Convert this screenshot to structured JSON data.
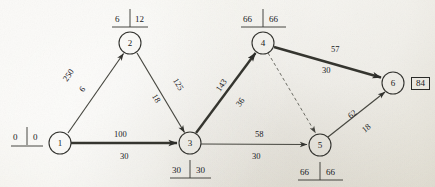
{
  "diagram": {
    "nodes": [
      {
        "id": "1",
        "label": "1",
        "cx": 60,
        "cy": 143,
        "r": 11
      },
      {
        "id": "2",
        "label": "2",
        "cx": 130,
        "cy": 43,
        "r": 11
      },
      {
        "id": "3",
        "label": "3",
        "cx": 190,
        "cy": 143,
        "r": 11
      },
      {
        "id": "4",
        "label": "4",
        "cx": 263,
        "cy": 43,
        "r": 11
      },
      {
        "id": "5",
        "label": "5",
        "cx": 320,
        "cy": 145,
        "r": 11
      },
      {
        "id": "6",
        "label": "6",
        "cx": 393,
        "cy": 83,
        "r": 11
      }
    ],
    "node_annotations": [
      {
        "node": "1",
        "left": "0",
        "right": "0",
        "position": "left",
        "x": 10,
        "y": 134
      },
      {
        "node": "2",
        "left": "6",
        "right": "12",
        "position": "top",
        "x": 106,
        "y": 14
      },
      {
        "node": "3",
        "left": "30",
        "right": "30",
        "position": "bottom",
        "x": 166,
        "y": 163
      },
      {
        "node": "4",
        "left": "66",
        "right": "66",
        "position": "top",
        "x": 239,
        "y": 14
      },
      {
        "node": "5",
        "left": "66",
        "right": "66",
        "position": "bottom",
        "x": 296,
        "y": 165
      },
      {
        "node": "6",
        "boxed": "84",
        "position": "right",
        "x": 411,
        "y": 77
      }
    ],
    "edges": [
      {
        "from": "1",
        "to": "2",
        "style": "thin",
        "upper": "250",
        "lower": "6",
        "upper_rot": -55,
        "lower_rot": -55
      },
      {
        "from": "2",
        "to": "3",
        "style": "thin",
        "upper": "125",
        "lower": "18",
        "upper_rot": 59,
        "lower_rot": 59
      },
      {
        "from": "1",
        "to": "3",
        "style": "bold",
        "upper": "100",
        "lower": "30",
        "upper_rot": 0,
        "lower_rot": 0
      },
      {
        "from": "3",
        "to": "4",
        "style": "bold",
        "upper": "143",
        "lower": "36",
        "upper_rot": -55,
        "lower_rot": -55
      },
      {
        "from": "4",
        "to": "6",
        "style": "bold",
        "upper": "57",
        "lower": "30",
        "upper_rot": 0,
        "lower_rot": 0
      },
      {
        "from": "3",
        "to": "5",
        "style": "thin",
        "upper": "58",
        "lower": "30",
        "upper_rot": 0,
        "lower_rot": 0
      },
      {
        "from": "5",
        "to": "6",
        "style": "thin",
        "upper": "62",
        "lower": "18",
        "upper_rot": -40,
        "lower_rot": -40
      },
      {
        "from": "4",
        "to": "5",
        "style": "dashed",
        "upper": "",
        "lower": "",
        "upper_rot": 0,
        "lower_rot": 0
      }
    ],
    "edge_labels": [
      {
        "text": "250",
        "x": 62,
        "y": 71,
        "rot": -55
      },
      {
        "text": "6",
        "x": 80,
        "y": 85,
        "rot": -55
      },
      {
        "text": "125",
        "x": 172,
        "y": 80,
        "rot": 59
      },
      {
        "text": "18",
        "x": 152,
        "y": 94,
        "rot": 59
      },
      {
        "text": "100",
        "x": 114,
        "y": 130
      },
      {
        "text": "30",
        "x": 120,
        "y": 152
      },
      {
        "text": "143",
        "x": 215,
        "y": 81,
        "rot": -55
      },
      {
        "text": "36",
        "x": 236,
        "y": 98,
        "rot": -55
      },
      {
        "text": "57",
        "x": 331,
        "y": 45
      },
      {
        "text": "30",
        "x": 322,
        "y": 66
      },
      {
        "text": "58",
        "x": 255,
        "y": 130
      },
      {
        "text": "30",
        "x": 252,
        "y": 152
      },
      {
        "text": "62",
        "x": 348,
        "y": 110,
        "rot": -40
      },
      {
        "text": "18",
        "x": 362,
        "y": 124,
        "rot": -40
      }
    ],
    "colors": {
      "ink": "#2a2a28",
      "paper": "#efede6",
      "bold_edge": "#3a3a37",
      "thin_edge": "#4a4a46"
    }
  }
}
